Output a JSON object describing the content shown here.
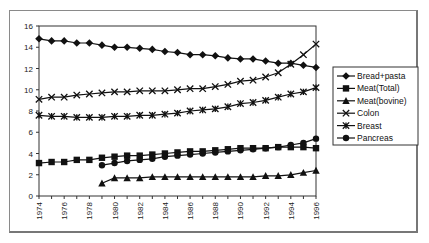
{
  "chart_data": {
    "type": "line",
    "title": "",
    "xlabel": "",
    "ylabel": "",
    "ylim": [
      0,
      16
    ],
    "yticks": [
      0,
      2,
      4,
      6,
      8,
      10,
      12,
      14,
      16
    ],
    "xlim": [
      1974,
      1996
    ],
    "xtick_labels": [
      "1974",
      "1976",
      "1978",
      "1980",
      "1982",
      "1984",
      "1986",
      "1988",
      "1990",
      "1992",
      "1994",
      "1996"
    ],
    "grid": false,
    "legend_position": "right",
    "x": [
      1974,
      1975,
      1976,
      1977,
      1978,
      1979,
      1980,
      1981,
      1982,
      1983,
      1984,
      1985,
      1986,
      1987,
      1988,
      1989,
      1990,
      1991,
      1992,
      1993,
      1994,
      1995,
      1996
    ],
    "series": [
      {
        "name": "Bread+pasta",
        "marker": "diamond",
        "values": [
          14.8,
          14.6,
          14.6,
          14.4,
          14.4,
          14.2,
          14.0,
          14.0,
          13.9,
          13.8,
          13.6,
          13.5,
          13.3,
          13.3,
          13.2,
          13.0,
          12.9,
          12.9,
          12.7,
          12.5,
          12.5,
          12.3,
          12.1
        ]
      },
      {
        "name": "Meat(Total)",
        "marker": "square",
        "values": [
          3.1,
          3.2,
          3.2,
          3.4,
          3.4,
          3.6,
          3.7,
          3.8,
          3.8,
          3.9,
          4.0,
          4.1,
          4.2,
          4.2,
          4.3,
          4.4,
          4.5,
          4.5,
          4.5,
          4.6,
          4.6,
          4.6,
          4.5
        ]
      },
      {
        "name": "Meat(bovine)",
        "marker": "triangle",
        "values": [
          null,
          null,
          null,
          null,
          null,
          1.2,
          1.7,
          1.7,
          1.7,
          1.8,
          1.8,
          1.8,
          1.8,
          1.8,
          1.8,
          1.8,
          1.8,
          1.8,
          1.9,
          1.9,
          2.0,
          2.2,
          2.4
        ]
      },
      {
        "name": "Colon",
        "marker": "x",
        "values": [
          9.1,
          9.3,
          9.3,
          9.5,
          9.6,
          9.7,
          9.8,
          9.8,
          9.9,
          9.9,
          9.9,
          10.0,
          10.1,
          10.1,
          10.3,
          10.5,
          10.8,
          10.9,
          11.2,
          11.6,
          12.4,
          13.3,
          14.3
        ]
      },
      {
        "name": "Breast",
        "marker": "asterisk",
        "values": [
          7.6,
          7.5,
          7.5,
          7.4,
          7.4,
          7.4,
          7.5,
          7.5,
          7.6,
          7.6,
          7.7,
          7.8,
          8.0,
          8.1,
          8.2,
          8.4,
          8.7,
          8.8,
          9.0,
          9.3,
          9.6,
          9.8,
          10.2
        ]
      },
      {
        "name": "Pancreas",
        "marker": "circle",
        "values": [
          null,
          null,
          null,
          null,
          null,
          2.9,
          3.1,
          3.3,
          3.4,
          3.5,
          3.7,
          3.8,
          3.9,
          4.0,
          4.1,
          4.2,
          4.3,
          4.4,
          4.5,
          4.6,
          4.8,
          5.0,
          5.4
        ]
      }
    ]
  }
}
